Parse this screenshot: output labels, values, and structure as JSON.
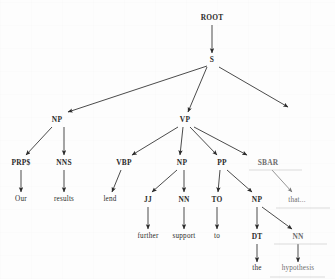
{
  "figure": {
    "kind": "constituency-parse-tree",
    "sentence": "Our results lend further support to the hypothesis that...",
    "background_color": "#fdfdfd",
    "ink_color": "#2b2b2b",
    "faded_ink_color": "#6d6d6d"
  },
  "nodes": {
    "root": {
      "label": "ROOT",
      "x": 212,
      "y": 18,
      "kind": "tag"
    },
    "s": {
      "label": "S",
      "x": 212,
      "y": 60,
      "kind": "tag"
    },
    "np_subject": {
      "label": "NP",
      "x": 57,
      "y": 120,
      "kind": "tag"
    },
    "vp": {
      "label": "VP",
      "x": 185,
      "y": 120,
      "kind": "tag"
    },
    "prp_dollar": {
      "label": "PRP$",
      "x": 21,
      "y": 163,
      "kind": "tag"
    },
    "nns": {
      "label": "NNS",
      "x": 64,
      "y": 163,
      "kind": "tag"
    },
    "vbp": {
      "label": "VBP",
      "x": 124,
      "y": 163,
      "kind": "tag"
    },
    "np_object": {
      "label": "NP",
      "x": 182,
      "y": 163,
      "kind": "tag"
    },
    "pp": {
      "label": "PP",
      "x": 222,
      "y": 163,
      "kind": "tag"
    },
    "sbar": {
      "label": "SBAR",
      "x": 268,
      "y": 163,
      "kind": "tag"
    },
    "word_our": {
      "label": "Our",
      "x": 21,
      "y": 200,
      "kind": "word"
    },
    "word_results": {
      "label": "results",
      "x": 64,
      "y": 200,
      "kind": "word"
    },
    "word_lend": {
      "label": "lend",
      "x": 110,
      "y": 200,
      "kind": "word"
    },
    "jj": {
      "label": "JJ",
      "x": 148,
      "y": 200,
      "kind": "tag"
    },
    "nn_support": {
      "label": "NN",
      "x": 184,
      "y": 200,
      "kind": "tag"
    },
    "to": {
      "label": "TO",
      "x": 217,
      "y": 200,
      "kind": "tag"
    },
    "np_pp": {
      "label": "NP",
      "x": 257,
      "y": 200,
      "kind": "tag"
    },
    "that_ellipsis": {
      "label": "that...",
      "x": 297,
      "y": 201,
      "kind": "word-faded"
    },
    "word_further": {
      "label": "further",
      "x": 148,
      "y": 237,
      "kind": "word"
    },
    "word_support": {
      "label": "support",
      "x": 184,
      "y": 237,
      "kind": "word"
    },
    "word_to": {
      "label": "to",
      "x": 217,
      "y": 237,
      "kind": "word"
    },
    "dt": {
      "label": "DT",
      "x": 257,
      "y": 237,
      "kind": "tag"
    },
    "nn_hypothesis": {
      "label": "NN",
      "x": 298,
      "y": 237,
      "kind": "tag"
    },
    "word_the": {
      "label": "the",
      "x": 257,
      "y": 269,
      "kind": "word"
    },
    "word_hypothesis": {
      "label": "hypothesis",
      "x": 298,
      "y": 269,
      "kind": "word"
    }
  },
  "edges": [
    {
      "from": "root",
      "to": "s"
    },
    {
      "from": "s",
      "to": "np_subject"
    },
    {
      "from": "s",
      "to": "vp"
    },
    {
      "from": "s",
      "to": "unlabeled_right"
    },
    {
      "from": "np_subject",
      "to": "prp_dollar"
    },
    {
      "from": "np_subject",
      "to": "nns"
    },
    {
      "from": "vp",
      "to": "vbp"
    },
    {
      "from": "vp",
      "to": "np_object"
    },
    {
      "from": "vp",
      "to": "pp"
    },
    {
      "from": "vp",
      "to": "sbar"
    },
    {
      "from": "prp_dollar",
      "to": "word_our"
    },
    {
      "from": "nns",
      "to": "word_results"
    },
    {
      "from": "vbp",
      "to": "word_lend"
    },
    {
      "from": "np_object",
      "to": "jj"
    },
    {
      "from": "np_object",
      "to": "nn_support"
    },
    {
      "from": "pp",
      "to": "to"
    },
    {
      "from": "pp",
      "to": "np_pp"
    },
    {
      "from": "sbar",
      "to": "that_ellipsis"
    },
    {
      "from": "jj",
      "to": "word_further"
    },
    {
      "from": "nn_support",
      "to": "word_support"
    },
    {
      "from": "to",
      "to": "word_to"
    },
    {
      "from": "np_pp",
      "to": "dt"
    },
    {
      "from": "np_pp",
      "to": "nn_hypothesis"
    },
    {
      "from": "dt",
      "to": "word_the"
    },
    {
      "from": "nn_hypothesis",
      "to": "word_hypothesis"
    }
  ]
}
